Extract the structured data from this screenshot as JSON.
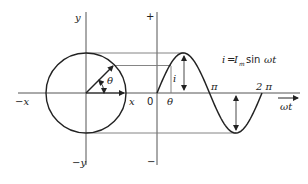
{
  "diagram": {
    "equation": {
      "lhs": "i",
      "equals": "=",
      "amplitude": "I",
      "amplitude_sub": "m",
      "func": "sin",
      "arg": "ωt"
    },
    "phasor_axes": {
      "pos_y": "y",
      "neg_y": "−y",
      "pos_x": "x",
      "neg_x": "−x"
    },
    "wave_axes": {
      "plus": "+",
      "minus": "−",
      "origin": "0",
      "theta": "θ",
      "pi": "π",
      "two_pi": "2 π",
      "time_axis": "ωt"
    },
    "phasor_angle_label": "θ",
    "instant_label": "i",
    "phasor_angle_deg": 45,
    "line_color": "#222222"
  }
}
